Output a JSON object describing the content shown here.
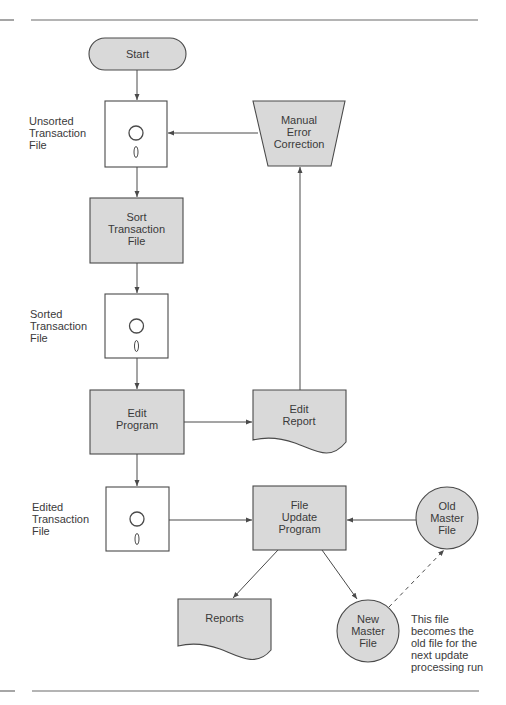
{
  "diagram": {
    "type": "system flowchart",
    "nodes": {
      "start": {
        "label": "Start",
        "shape": "terminal"
      },
      "unsorted_file": {
        "label_lines": [
          "Unsorted",
          "Transaction",
          "File"
        ],
        "shape": "diskette"
      },
      "manual_correction": {
        "label_lines": [
          "Manual",
          "Error",
          "Correction"
        ],
        "shape": "manual-operation"
      },
      "sort": {
        "label_lines": [
          "Sort",
          "Transaction",
          "File"
        ],
        "shape": "process"
      },
      "sorted_file": {
        "label_lines": [
          "Sorted",
          "Transaction",
          "File"
        ],
        "shape": "diskette"
      },
      "edit_program": {
        "label_lines": [
          "Edit",
          "Program"
        ],
        "shape": "process"
      },
      "edit_report": {
        "label_lines": [
          "Edit",
          "Report"
        ],
        "shape": "document"
      },
      "edited_file": {
        "label_lines": [
          "Edited",
          "Transaction",
          "File"
        ],
        "shape": "diskette"
      },
      "file_update": {
        "label_lines": [
          "File",
          "Update",
          "Program"
        ],
        "shape": "process"
      },
      "old_master": {
        "label_lines": [
          "Old",
          "Master",
          "File"
        ],
        "shape": "circle"
      },
      "reports": {
        "label": "Reports",
        "shape": "document"
      },
      "new_master": {
        "label_lines": [
          "New",
          "Master",
          "File"
        ],
        "shape": "circle"
      }
    },
    "edges": [
      {
        "from": "Start",
        "to": "Unsorted Transaction File"
      },
      {
        "from": "Unsorted Transaction File",
        "to": "Sort Transaction File"
      },
      {
        "from": "Sort Transaction File",
        "to": "Sorted Transaction File"
      },
      {
        "from": "Sorted Transaction File",
        "to": "Edit Program"
      },
      {
        "from": "Edit Program",
        "to": "Edit Report"
      },
      {
        "from": "Edit Report",
        "to": "Manual Error Correction"
      },
      {
        "from": "Manual Error Correction",
        "to": "Unsorted Transaction File"
      },
      {
        "from": "Edit Program",
        "to": "Edited Transaction File"
      },
      {
        "from": "Edited Transaction File",
        "to": "File Update Program"
      },
      {
        "from": "Old Master File",
        "to": "File Update Program"
      },
      {
        "from": "File Update Program",
        "to": "Reports"
      },
      {
        "from": "File Update Program",
        "to": "New Master File"
      },
      {
        "from": "New Master File",
        "to": "Old Master File",
        "style": "dashed"
      }
    ],
    "annotation_lines": [
      "This file",
      "becomes the",
      "old file for the",
      "next update",
      "processing run"
    ]
  },
  "colors": {
    "shape_fill": "#d9d9d9",
    "stroke": "#4a4a4a",
    "text": "#3a3a3a"
  }
}
